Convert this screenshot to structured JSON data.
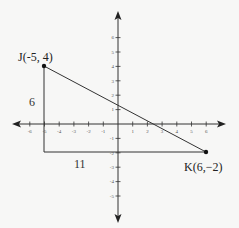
{
  "chart_data": {
    "type": "coordinate-plane",
    "title": "",
    "xlim": [
      -6,
      6
    ],
    "ylim": [
      -5,
      6
    ],
    "x_ticks": [
      "-6",
      "-5",
      "-4",
      "-3",
      "-2",
      "-1",
      "1",
      "2",
      "3",
      "4",
      "5",
      "6"
    ],
    "y_ticks": [
      "6",
      "5",
      "4",
      "3",
      "2",
      "1",
      "-1",
      "-2",
      "-3",
      "-4",
      "-5"
    ],
    "grid": false,
    "points": [
      {
        "name": "J",
        "x": -5,
        "y": 4,
        "label": "J(-5, 4)"
      },
      {
        "name": "K",
        "x": 6,
        "y": -2,
        "label": "K(6,−2)"
      }
    ],
    "segments": [
      {
        "from": "J",
        "to": "K",
        "kind": "hypotenuse"
      },
      {
        "from": [
          -5,
          4
        ],
        "to": [
          -5,
          -2
        ],
        "kind": "vertical leg",
        "length_label": "6"
      },
      {
        "from": [
          -5,
          -2
        ],
        "to": [
          6,
          -2
        ],
        "kind": "horizontal leg",
        "length_label": "11"
      }
    ]
  },
  "labels": {
    "point_j": "J(-5, 4)",
    "point_k": "K(6,−2)",
    "vertical_leg": "6",
    "horizontal_leg": "11"
  },
  "x_axis": {
    "ticks": [
      {
        "label": "-6"
      },
      {
        "label": "-5"
      },
      {
        "label": "-4"
      },
      {
        "label": "-3"
      },
      {
        "label": "-2"
      },
      {
        "label": "-1"
      },
      {
        "label": "1"
      },
      {
        "label": "2"
      },
      {
        "label": "3"
      },
      {
        "label": "4"
      },
      {
        "label": "5"
      },
      {
        "label": "6"
      }
    ]
  },
  "y_axis": {
    "ticks": [
      {
        "label": "6"
      },
      {
        "label": "5"
      },
      {
        "label": "4"
      },
      {
        "label": "3"
      },
      {
        "label": "2"
      },
      {
        "label": "1"
      },
      {
        "label": "-1"
      },
      {
        "label": "-2"
      },
      {
        "label": "-3"
      },
      {
        "label": "-4"
      },
      {
        "label": "-5"
      }
    ]
  },
  "colors": {
    "background": "#f7f7f6",
    "ink": "#222222",
    "axis": "#333333"
  }
}
